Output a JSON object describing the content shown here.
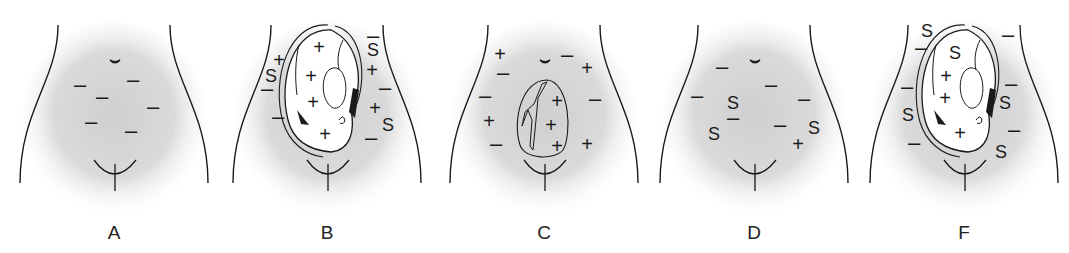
{
  "figure": {
    "panels": [
      {
        "label": "A",
        "offset_x": 0,
        "has_fetus": false,
        "has_mass": false,
        "marks": [
          {
            "t": "–",
            "x": 80,
            "y": 85
          },
          {
            "t": "–",
            "x": 133,
            "y": 80
          },
          {
            "t": "–",
            "x": 102,
            "y": 97
          },
          {
            "t": "–",
            "x": 153,
            "y": 107
          },
          {
            "t": "–",
            "x": 91,
            "y": 122
          },
          {
            "t": "–",
            "x": 131,
            "y": 131
          }
        ]
      },
      {
        "label": "B",
        "offset_x": 213,
        "has_fetus": true,
        "has_mass": false,
        "marks": [
          {
            "t": "+",
            "x": 66,
            "y": 60
          },
          {
            "t": "S",
            "x": 58,
            "y": 76
          },
          {
            "t": "–",
            "x": 54,
            "y": 89
          },
          {
            "t": "–",
            "x": 65,
            "y": 117
          },
          {
            "t": "+",
            "x": 106,
            "y": 47
          },
          {
            "t": "+",
            "x": 98,
            "y": 76
          },
          {
            "t": "+",
            "x": 100,
            "y": 102
          },
          {
            "t": "+",
            "x": 112,
            "y": 134
          },
          {
            "t": "–",
            "x": 160,
            "y": 36
          },
          {
            "t": "S",
            "x": 160,
            "y": 50
          },
          {
            "t": "+",
            "x": 159,
            "y": 70
          },
          {
            "t": "–",
            "x": 172,
            "y": 88
          },
          {
            "t": "+",
            "x": 162,
            "y": 108
          },
          {
            "t": "S",
            "x": 175,
            "y": 125
          },
          {
            "t": "–",
            "x": 158,
            "y": 138
          }
        ]
      },
      {
        "label": "C",
        "offset_x": 430,
        "has_fetus": false,
        "has_mass": true,
        "marks": [
          {
            "t": "+",
            "x": 70,
            "y": 54
          },
          {
            "t": "–",
            "x": 73,
            "y": 73
          },
          {
            "t": "–",
            "x": 55,
            "y": 96
          },
          {
            "t": "+",
            "x": 59,
            "y": 121
          },
          {
            "t": "–",
            "x": 66,
            "y": 144
          },
          {
            "t": "–",
            "x": 137,
            "y": 55
          },
          {
            "t": "+",
            "x": 157,
            "y": 68
          },
          {
            "t": "–",
            "x": 165,
            "y": 99
          },
          {
            "t": "+",
            "x": 127,
            "y": 101
          },
          {
            "t": "+",
            "x": 121,
            "y": 125
          },
          {
            "t": "+",
            "x": 127,
            "y": 146
          },
          {
            "t": "+",
            "x": 157,
            "y": 144
          }
        ]
      },
      {
        "label": "D",
        "offset_x": 640,
        "has_fetus": false,
        "has_mass": false,
        "marks": [
          {
            "t": "–",
            "x": 82,
            "y": 67
          },
          {
            "t": "–",
            "x": 131,
            "y": 85
          },
          {
            "t": "–",
            "x": 57,
            "y": 96
          },
          {
            "t": "S",
            "x": 93,
            "y": 103
          },
          {
            "t": "–",
            "x": 93,
            "y": 118
          },
          {
            "t": "–",
            "x": 164,
            "y": 99
          },
          {
            "t": "–",
            "x": 140,
            "y": 125
          },
          {
            "t": "S",
            "x": 74,
            "y": 134
          },
          {
            "t": "S",
            "x": 174,
            "y": 128
          },
          {
            "t": "+",
            "x": 158,
            "y": 144
          }
        ]
      },
      {
        "label": "F",
        "offset_x": 850,
        "has_fetus": true,
        "has_mass": false,
        "marks": [
          {
            "t": "S",
            "x": 77,
            "y": 31
          },
          {
            "t": "–",
            "x": 71,
            "y": 48
          },
          {
            "t": "S",
            "x": 105,
            "y": 53
          },
          {
            "t": "+",
            "x": 96,
            "y": 76
          },
          {
            "t": "+",
            "x": 95,
            "y": 98
          },
          {
            "t": "+",
            "x": 110,
            "y": 133
          },
          {
            "t": "–",
            "x": 57,
            "y": 87
          },
          {
            "t": "S",
            "x": 58,
            "y": 115
          },
          {
            "t": "–",
            "x": 64,
            "y": 143
          },
          {
            "t": "–",
            "x": 158,
            "y": 35
          },
          {
            "t": "–",
            "x": 161,
            "y": 84
          },
          {
            "t": "S",
            "x": 155,
            "y": 103
          },
          {
            "t": "–",
            "x": 164,
            "y": 130
          },
          {
            "t": "S",
            "x": 151,
            "y": 152
          }
        ]
      }
    ]
  },
  "colors": {
    "ink": "#1a1a1a",
    "shade": "#d6d6d6",
    "background": "#ffffff"
  }
}
